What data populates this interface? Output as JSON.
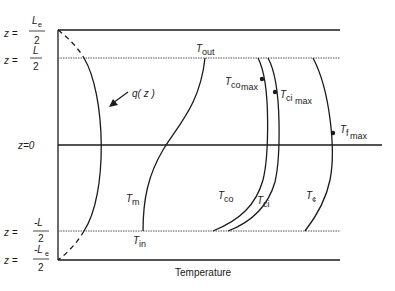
{
  "figure": {
    "xlabel": "Temperature",
    "colors": {
      "ink": "#1a1a1a",
      "dotted": "#555555"
    }
  },
  "z_labels": [
    {
      "prefix": "z =",
      "num": "L",
      "sub": "e",
      "den": "2",
      "sign": ""
    },
    {
      "prefix": "z =",
      "num": "L",
      "sub": "",
      "den": "2",
      "sign": ""
    },
    {
      "prefix": "z=0"
    },
    {
      "prefix": "z =",
      "num": "-L",
      "sub": "",
      "den": "2",
      "sign": "-"
    },
    {
      "prefix": "z =",
      "num": "-L",
      "sub": "e",
      "den": "2",
      "sign": "-"
    }
  ],
  "curves": {
    "q": {
      "label": "q( z )"
    },
    "Tm": {
      "label": "T",
      "sub": "m"
    },
    "Tin": {
      "label": "T",
      "sub": "in"
    },
    "Tout": {
      "label": "T",
      "sub": "out"
    },
    "Tco": {
      "label": "T",
      "sub": "co"
    },
    "Tci": {
      "label": "T",
      "sub": "ci"
    },
    "Tcl": {
      "label": "T",
      "sub": "¢"
    },
    "Tcomax": {
      "label": "T",
      "sub": "co",
      "sub2": "max"
    },
    "Tcimax": {
      "label": "T",
      "sub": "ci",
      "sub2": "max"
    },
    "Tfmax": {
      "label": "T",
      "sub": "f",
      "sub2": "max"
    }
  }
}
